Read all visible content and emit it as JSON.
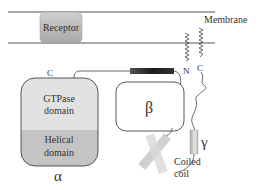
{
  "diagram": {
    "membrane_label": "Membrane",
    "receptor_label": "Receptor",
    "alpha": {
      "symbol": "α",
      "c_terminus": "C",
      "gtpase_line1": "GTPase",
      "gtpase_line2": "domain",
      "helical_line1": "Helical",
      "helical_line2": "domain"
    },
    "beta": {
      "symbol": "β"
    },
    "gamma": {
      "symbol": "γ"
    },
    "lipid_anchors": {
      "n_label": "N",
      "c_label": "C"
    },
    "coiled_coil_line1": "Coiled",
    "coiled_coil_line2": "coil"
  },
  "colors": {
    "membrane_line": "#555555",
    "receptor_fill": "#b8b8b8",
    "gtpase_fill": "#e2e2e2",
    "helical_fill": "#c4c4c4",
    "outline": "#444444",
    "helix_bar_dark": "#222222",
    "text": "#333333"
  }
}
